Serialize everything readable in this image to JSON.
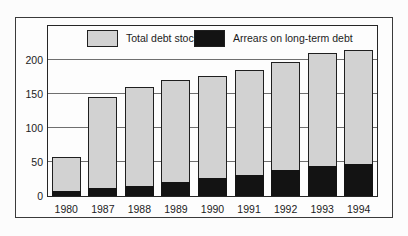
{
  "chart_data": {
    "type": "bar",
    "categories": [
      "1980",
      "1987",
      "1988",
      "1989",
      "1990",
      "1991",
      "1992",
      "1993",
      "1994"
    ],
    "series": [
      {
        "name": "Total debt stock",
        "color": "#d2d2d2",
        "values": [
          58,
          145,
          160,
          170,
          176,
          186,
          197,
          210,
          214
        ]
      },
      {
        "name": "Arrears on long-term debt",
        "color": "#131313",
        "values": [
          7,
          12,
          15,
          20,
          27,
          31,
          38,
          44,
          47
        ]
      }
    ],
    "yticks": [
      0,
      50,
      100,
      150,
      200
    ],
    "ylim": [
      0,
      250
    ],
    "grid": true,
    "legend_position": "top"
  }
}
